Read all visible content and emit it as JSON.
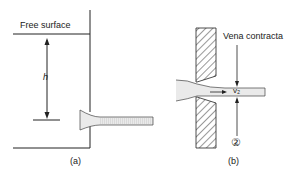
{
  "figure_a": {
    "free_surface_label": "Free surface",
    "head_label": "h",
    "caption": "(a)"
  },
  "figure_b": {
    "vena_contracta_label": "Vena contracta",
    "velocity_label": "v₂",
    "section_label": "②",
    "caption": "(b)"
  }
}
